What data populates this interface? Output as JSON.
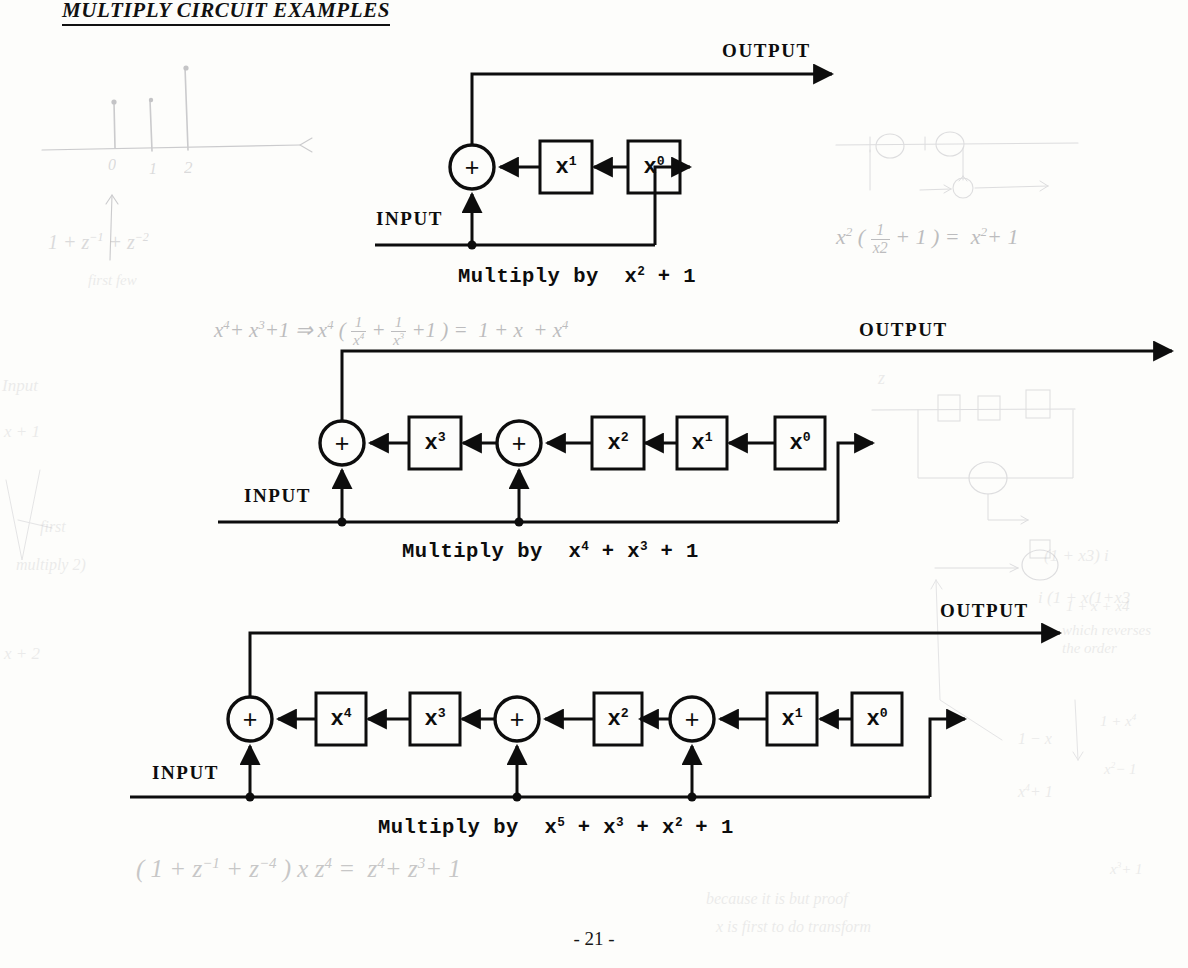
{
  "document": {
    "title": "MULTIPLY CIRCUIT EXAMPLES",
    "page_number": "- 21 -"
  },
  "labels": {
    "input": "INPUT",
    "output": "OUTPUT",
    "plus": "+"
  },
  "circuits": [
    {
      "id": "circuit-1",
      "caption_prefix": "Multiply by",
      "caption_polynomial_plain": "x2 + 1",
      "caption_terms": [
        {
          "base": "x",
          "exp": "2"
        },
        {
          "op": "+"
        },
        {
          "base": "1",
          "exp": ""
        }
      ],
      "input_label": "INPUT",
      "output_label": "OUTPUT",
      "stages": [
        {
          "kind": "adder",
          "label": "+",
          "tap": true
        },
        {
          "kind": "delay",
          "base": "x",
          "exp": "1"
        },
        {
          "kind": "delay",
          "base": "x",
          "exp": "0"
        }
      ]
    },
    {
      "id": "circuit-2",
      "caption_prefix": "Multiply by",
      "caption_polynomial_plain": "x4 + x3 + 1",
      "caption_terms": [
        {
          "base": "x",
          "exp": "4"
        },
        {
          "op": "+"
        },
        {
          "base": "x",
          "exp": "3"
        },
        {
          "op": "+"
        },
        {
          "base": "1",
          "exp": ""
        }
      ],
      "input_label": "INPUT",
      "output_label": "OUTPUT",
      "stages": [
        {
          "kind": "adder",
          "label": "+",
          "tap": true
        },
        {
          "kind": "delay",
          "base": "x",
          "exp": "3"
        },
        {
          "kind": "adder",
          "label": "+",
          "tap": true
        },
        {
          "kind": "delay",
          "base": "x",
          "exp": "2"
        },
        {
          "kind": "delay",
          "base": "x",
          "exp": "1"
        },
        {
          "kind": "delay",
          "base": "x",
          "exp": "0"
        }
      ]
    },
    {
      "id": "circuit-3",
      "caption_prefix": "Multiply by",
      "caption_polynomial_plain": "x5 + x3 + x2 + 1",
      "caption_terms": [
        {
          "base": "x",
          "exp": "5"
        },
        {
          "op": "+"
        },
        {
          "base": "x",
          "exp": "3"
        },
        {
          "op": "+"
        },
        {
          "base": "x",
          "exp": "2"
        },
        {
          "op": "+"
        },
        {
          "base": "1",
          "exp": ""
        }
      ],
      "input_label": "INPUT",
      "output_label": "OUTPUT",
      "stages": [
        {
          "kind": "adder",
          "label": "+",
          "tap": true
        },
        {
          "kind": "delay",
          "base": "x",
          "exp": "4"
        },
        {
          "kind": "delay",
          "base": "x",
          "exp": "3"
        },
        {
          "kind": "adder",
          "label": "+",
          "tap": true
        },
        {
          "kind": "delay",
          "base": "x",
          "exp": "2"
        },
        {
          "kind": "adder",
          "label": "+",
          "tap": true
        },
        {
          "kind": "delay",
          "base": "x",
          "exp": "1"
        },
        {
          "kind": "delay",
          "base": "x",
          "exp": "0"
        }
      ]
    }
  ],
  "annotations": {
    "stem_axis_ticks": [
      "0",
      "1",
      "2"
    ],
    "left_poly": "1 + z-1 + z-2",
    "left_note_1": "first few",
    "left_margin_1": "Input",
    "left_margin_2": "x + 1",
    "left_margin_3": "first",
    "left_margin_4": "multiply 2)",
    "mid_derivation_lhs": "x4 + x3 + 1",
    "mid_derivation_arrow": "=>",
    "mid_derivation_rhs": "= 1 + x + x4",
    "right_identity": "= x2 + 1",
    "right_note_a": "(1 + x3) i",
    "right_note_b": "i (1 + x(1+x3",
    "right_note_c": "1 + x + x4",
    "right_note_d": "which reverses",
    "right_note_e": "the order",
    "bottom_identity_lhs": "(1 + z-1 + z-4) x z4",
    "bottom_identity_rhs": "= z4 + z3 + 1",
    "bottom_note_1": "because it is but proof",
    "bottom_note_2": "x is first to do transform"
  },
  "colors": {
    "ink": "#0d0d0d",
    "paper": "#fdfdfb",
    "pencil": "#7d7d82",
    "pencil_faint": "#9a9aa0"
  }
}
